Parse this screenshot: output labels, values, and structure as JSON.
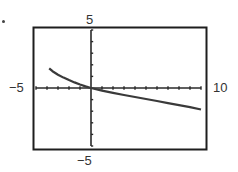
{
  "chart_data": {
    "type": "line",
    "title": "",
    "xlabel": "",
    "ylabel": "",
    "xlim": [
      -5,
      10
    ],
    "ylim": [
      -5,
      5
    ],
    "xscale": 1,
    "yscale": 1,
    "grid": false,
    "legend": null,
    "window_labels": {
      "xmin": "−5",
      "xmax": "10",
      "ymin": "−5",
      "ymax": "5"
    },
    "series": [
      {
        "name": "f(x)",
        "x": [
          -3.8,
          -3.5,
          -3.0,
          -2.5,
          -2.0,
          -1.5,
          -1.0,
          -0.5,
          0,
          1,
          2,
          3,
          4,
          5,
          6,
          7,
          8,
          9,
          10
        ],
        "y": [
          1.7,
          1.45,
          1.15,
          0.9,
          0.68,
          0.48,
          0.3,
          0.14,
          0,
          -0.22,
          -0.42,
          -0.6,
          -0.78,
          -0.95,
          -1.12,
          -1.3,
          -1.47,
          -1.65,
          -1.85
        ]
      }
    ]
  },
  "colors": {
    "frame": "#1e1e1e",
    "axes": "#2a2a2a",
    "curve": "#3a3a3a",
    "background": "#ffffff"
  }
}
